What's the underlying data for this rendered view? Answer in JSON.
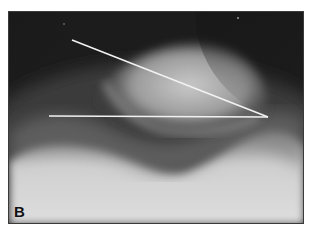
{
  "figure": {
    "panel_label": "B",
    "colors": {
      "background": "#1c1c1c",
      "bone_light": "#d8d8d8",
      "lines": "#f2f2f2",
      "border": "#3a3a3a"
    },
    "measurement_lines": [
      {
        "name": "oblique-line",
        "x1": 63,
        "y1": 28,
        "x2": 259,
        "y2": 105
      },
      {
        "name": "horizontal-line",
        "x1": 40,
        "y1": 104,
        "x2": 259,
        "y2": 105
      }
    ]
  }
}
